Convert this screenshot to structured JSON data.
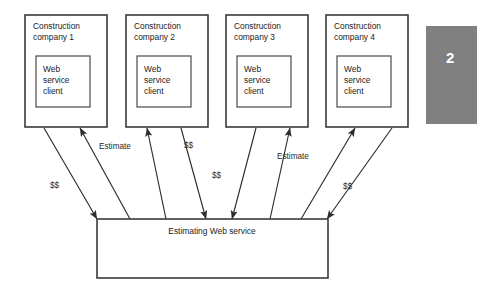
{
  "diagram": {
    "companies": [
      {
        "id": "company-1",
        "label_line1": "Construction",
        "label_line2": "company 1",
        "client_line1": "Web",
        "client_line2": "service",
        "client_line3": "client"
      },
      {
        "id": "company-2",
        "label_line1": "Construction",
        "label_line2": "company 2",
        "client_line1": "Web",
        "client_line2": "service",
        "client_line3": "client"
      },
      {
        "id": "company-3",
        "label_line1": "Construction",
        "label_line2": "company 3",
        "client_line1": "Web",
        "client_line2": "service",
        "client_line3": "client"
      },
      {
        "id": "company-4",
        "label_line1": "Construction",
        "label_line2": "company 4",
        "client_line1": "Web",
        "client_line2": "service",
        "client_line3": "client"
      }
    ],
    "service": {
      "label": "Estimating Web service"
    },
    "edge_labels": {
      "money_left": "$$",
      "estimate_left": "Estimate",
      "money_mid_left": "$$",
      "money_mid_right": "$$",
      "estimate_right": "Estimate",
      "money_right": "$$"
    },
    "badge": {
      "number": "2",
      "fill": "#808080",
      "text_color": "#ffffff"
    },
    "colors": {
      "background": "#ffffff",
      "box_stroke": "#3a3a3a",
      "inner_stroke": "#4a4a4a",
      "text": "#1b1b1b",
      "line": "#2d2d2d"
    }
  }
}
